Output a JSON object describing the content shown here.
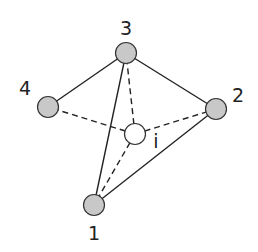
{
  "diagram": {
    "title": "",
    "nodes": [
      {
        "id": "1",
        "label": "1",
        "x": 94,
        "y": 205,
        "fill": "#c8c8c8"
      },
      {
        "id": "2",
        "label": "2",
        "x": 216,
        "y": 109,
        "fill": "#c8c8c8"
      },
      {
        "id": "3",
        "label": "3",
        "x": 126,
        "y": 53,
        "fill": "#c8c8c8"
      },
      {
        "id": "4",
        "label": "4",
        "x": 48,
        "y": 107,
        "fill": "#c8c8c8"
      },
      {
        "id": "i",
        "label": "i",
        "x": 135,
        "y": 134,
        "fill": "#ffffff"
      }
    ],
    "edges_solid": [
      [
        "3",
        "4"
      ],
      [
        "3",
        "2"
      ],
      [
        "3",
        "1"
      ],
      [
        "2",
        "1"
      ]
    ],
    "edges_dashed": [
      [
        "i",
        "3"
      ],
      [
        "i",
        "4"
      ],
      [
        "i",
        "2"
      ],
      [
        "i",
        "1"
      ]
    ],
    "labels": {
      "n1": "1",
      "n2": "2",
      "n3": "3",
      "n4": "4",
      "ni": "i"
    }
  }
}
